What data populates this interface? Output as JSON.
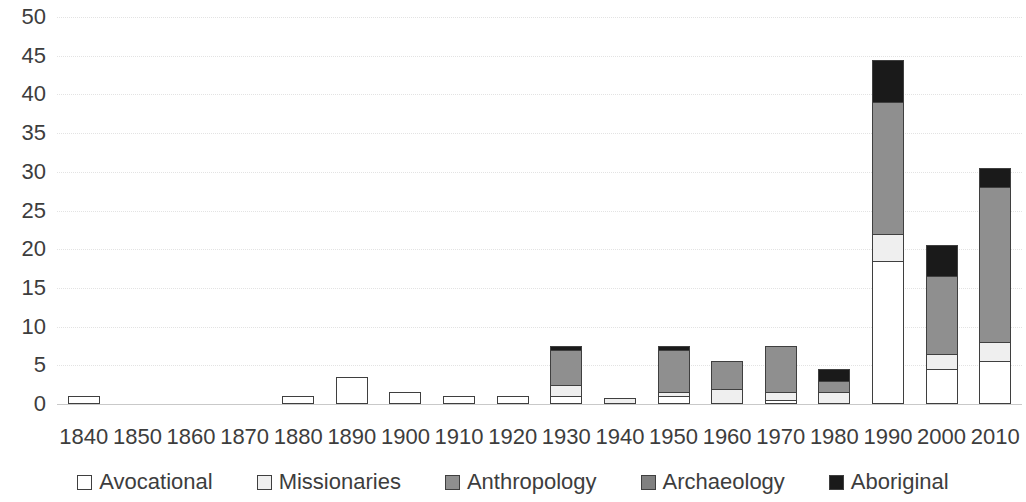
{
  "chart_data": {
    "type": "bar",
    "stacked": true,
    "title": "",
    "subtitle": "",
    "xlabel": "",
    "ylabel": "",
    "ylim": [
      0,
      50
    ],
    "ytick_step": 5,
    "yticks": [
      "0",
      "5",
      "10",
      "15",
      "20",
      "25",
      "30",
      "35",
      "40",
      "45",
      "50"
    ],
    "grid": true,
    "legend_position": "bottom",
    "categories": [
      "1840",
      "1850",
      "1860",
      "1870",
      "1880",
      "1890",
      "1900",
      "1910",
      "1920",
      "1930",
      "1940",
      "1950",
      "1960",
      "1970",
      "1980",
      "1990",
      "2000",
      "2010"
    ],
    "series": [
      {
        "name": "Avocational",
        "color": "#ffffff",
        "values": [
          1,
          0,
          0,
          0,
          1,
          3.5,
          1.5,
          1,
          1,
          1,
          0,
          1,
          0,
          0.5,
          0,
          18.5,
          4.5,
          5.5
        ]
      },
      {
        "name": "Missionaries",
        "color": "#efefef",
        "values": [
          0,
          0,
          0,
          0,
          0,
          0,
          0,
          0,
          0,
          1.5,
          0.8,
          0.5,
          2,
          1,
          1.5,
          3.5,
          2,
          2.5
        ]
      },
      {
        "name": "Anthropology",
        "color": "#8f8f8f",
        "values": [
          0,
          0,
          0,
          0,
          0,
          0,
          0,
          0,
          0,
          4.5,
          0,
          5.5,
          3.5,
          6,
          1.5,
          17,
          10,
          20
        ]
      },
      {
        "name": "Archaeology",
        "color": "#808080",
        "values": [
          0,
          0,
          0,
          0,
          0,
          0,
          0,
          0,
          0,
          0,
          0,
          0,
          0,
          0,
          0,
          0,
          0,
          0
        ]
      },
      {
        "name": "Aboriginal",
        "color": "#1a1a1a",
        "values": [
          0,
          0,
          0,
          0,
          0,
          0,
          0,
          0,
          0,
          0.5,
          0,
          0.5,
          0,
          0,
          1.5,
          5.5,
          4,
          2.5
        ]
      }
    ],
    "totals": [
      1,
      0,
      0,
      0,
      1,
      3.5,
      1.5,
      1,
      1,
      7.5,
      0.8,
      7.5,
      5.5,
      7.5,
      4.5,
      44.5,
      20.5,
      30.5
    ]
  },
  "legend": {
    "items": [
      {
        "label": "Avocational",
        "swatch": "avocational-swatch"
      },
      {
        "label": "Missionaries",
        "swatch": "missionaries-swatch"
      },
      {
        "label": "Anthropology",
        "swatch": "anthropology-swatch"
      },
      {
        "label": "Archaeology",
        "swatch": "archaeology-swatch"
      },
      {
        "label": "Aboriginal",
        "swatch": "aboriginal-swatch"
      }
    ]
  }
}
